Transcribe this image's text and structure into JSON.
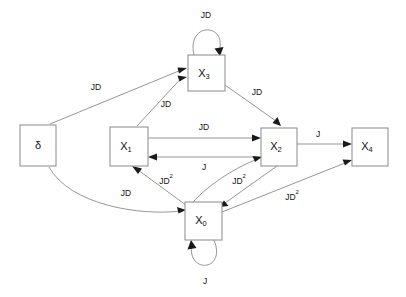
{
  "diagram": {
    "background_color": "#ffffff",
    "stroke_color": "#8a8a8a",
    "text_color": "#111111",
    "nodes": [
      {
        "id": "delta",
        "label": "δ",
        "sub": "",
        "x": 20,
        "y": 125,
        "w": 36,
        "h": 41
      },
      {
        "id": "x3",
        "label": "X",
        "sub": "3",
        "x": 188,
        "y": 55,
        "w": 37,
        "h": 36
      },
      {
        "id": "x1",
        "label": "X",
        "sub": "1",
        "x": 110,
        "y": 127,
        "w": 38,
        "h": 39
      },
      {
        "id": "x2",
        "label": "X",
        "sub": "2",
        "x": 261,
        "y": 128,
        "w": 36,
        "h": 38
      },
      {
        "id": "x4",
        "label": "X",
        "sub": "4",
        "x": 352,
        "y": 128,
        "w": 36,
        "h": 38
      },
      {
        "id": "x0",
        "label": "X",
        "sub": "0",
        "x": 185,
        "y": 202,
        "w": 37,
        "h": 38
      }
    ],
    "edges": [
      {
        "id": "delta-x3",
        "from": "delta",
        "to": "x3",
        "label": "JD",
        "label_sup": "",
        "label_x": 96,
        "label_y": 88
      },
      {
        "id": "x1-x3",
        "from": "x1",
        "to": "x3",
        "label": "JD",
        "label_sup": "",
        "label_x": 166,
        "label_y": 105
      },
      {
        "id": "x3-x3",
        "from": "x3",
        "to": "x3",
        "label": "JD",
        "label_sup": "",
        "label_x": 206,
        "label_y": 16
      },
      {
        "id": "x3-x2",
        "from": "x3",
        "to": "x2",
        "label": "JD",
        "label_sup": "",
        "label_x": 257,
        "label_y": 93
      },
      {
        "id": "x1-x2",
        "from": "x1",
        "to": "x2",
        "label": "JD",
        "label_sup": "",
        "label_x": 204,
        "label_y": 128
      },
      {
        "id": "x2-x1",
        "from": "x2",
        "to": "x1",
        "label": "J",
        "label_sup": "",
        "label_x": 204,
        "label_y": 168
      },
      {
        "id": "x2-x4",
        "from": "x2",
        "to": "x4",
        "label": "J",
        "label_sup": "",
        "label_x": 318,
        "label_y": 135
      },
      {
        "id": "delta-x0",
        "from": "delta",
        "to": "x0",
        "label": "JD",
        "label_sup": "",
        "label_x": 126,
        "label_y": 194
      },
      {
        "id": "x0-x1",
        "from": "x0",
        "to": "x1",
        "label": "JD",
        "label_sup": "2",
        "label_x": 166,
        "label_y": 182
      },
      {
        "id": "x0-x2",
        "from": "x0",
        "to": "x2",
        "label": "JD",
        "label_sup": "2",
        "label_x": 239,
        "label_y": 182
      },
      {
        "id": "x2-x0",
        "from": "x2",
        "to": "x0",
        "label": "",
        "label_sup": "",
        "label_x": 0,
        "label_y": 0
      },
      {
        "id": "x0-x4",
        "from": "x0",
        "to": "x4",
        "label": "JD",
        "label_sup": "2",
        "label_x": 292,
        "label_y": 198
      },
      {
        "id": "x0-x0",
        "from": "x0",
        "to": "x0",
        "label": "J",
        "label_sup": "",
        "label_x": 205,
        "label_y": 282
      }
    ]
  }
}
